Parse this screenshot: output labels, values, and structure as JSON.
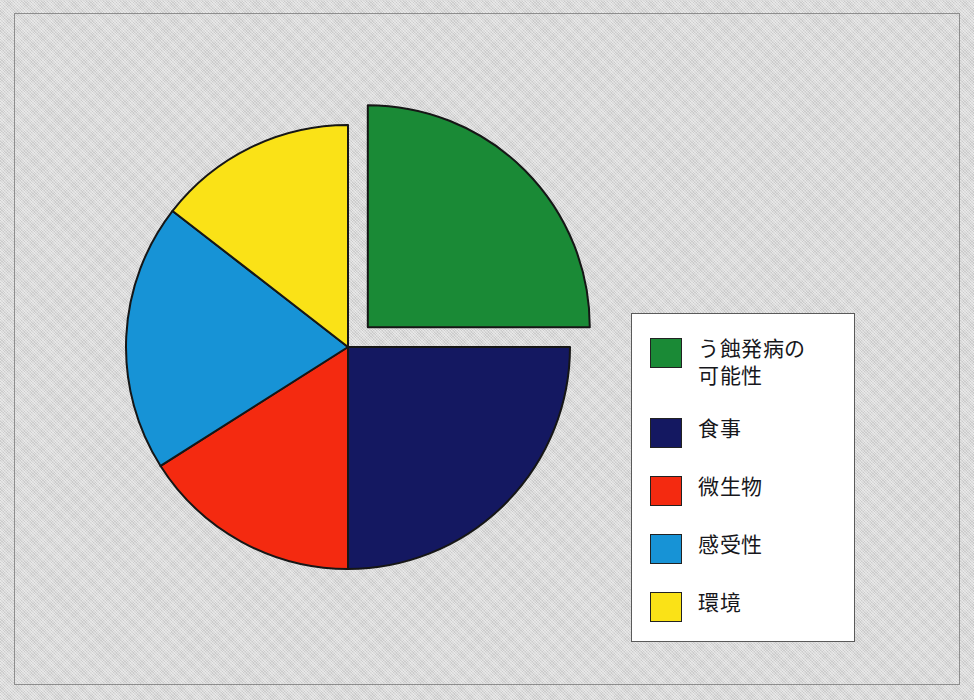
{
  "figure": {
    "background_color": "#d2d2d2",
    "frame_color": "#8e8e8e"
  },
  "chart_data": {
    "type": "pie",
    "title": "",
    "subtitle": "",
    "xlabel": "",
    "ylabel": "",
    "legend_position": "right",
    "grid": false,
    "exploded_slices": [
      "う蝕発病の可能性"
    ],
    "start_angle_deg": -90,
    "direction": "clockwise",
    "categories": [
      "う蝕発病の可能性",
      "食事",
      "微生物",
      "感受性",
      "環境"
    ],
    "values": [
      25,
      25,
      16,
      19.5,
      14.5
    ],
    "units": "percent",
    "colors": [
      "#1a8a36",
      "#141861",
      "#f42a10",
      "#1793d6",
      "#fae217"
    ],
    "slices": [
      {
        "label": "う蝕発病の可能性",
        "value": 25,
        "color": "#1a8a36",
        "start_angle_deg": -90,
        "end_angle_deg": 0,
        "exploded": true
      },
      {
        "label": "食事",
        "value": 25,
        "color": "#141861",
        "start_angle_deg": 0,
        "end_angle_deg": 90,
        "exploded": false
      },
      {
        "label": "微生物",
        "value": 16,
        "color": "#f42a10",
        "start_angle_deg": 90,
        "end_angle_deg": 147.6,
        "exploded": false
      },
      {
        "label": "感受性",
        "value": 19.5,
        "color": "#1793d6",
        "start_angle_deg": 147.6,
        "end_angle_deg": 217.8,
        "exploded": false
      },
      {
        "label": "環境",
        "value": 14.5,
        "color": "#fae217",
        "start_angle_deg": 217.8,
        "end_angle_deg": 270,
        "exploded": false
      }
    ]
  },
  "legend": {
    "items": [
      {
        "label": "う蝕発病の\n可能性",
        "color": "#1a8a36"
      },
      {
        "label": "食事",
        "color": "#141861"
      },
      {
        "label": "微生物",
        "color": "#f42a10"
      },
      {
        "label": "感受性",
        "color": "#1793d6"
      },
      {
        "label": "環境",
        "color": "#fae217"
      }
    ]
  }
}
